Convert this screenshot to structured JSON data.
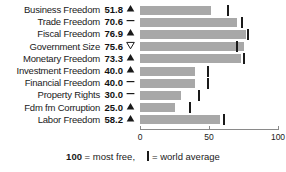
{
  "chart_data": {
    "type": "bar",
    "title": "",
    "xlabel": "",
    "ylabel": "",
    "xlim": [
      0,
      100
    ],
    "ticks": [
      0,
      50,
      100
    ],
    "tick_labels": [
      "0",
      "50",
      "100"
    ],
    "grid": false,
    "orientation": "horizontal",
    "legend": {
      "most_free_value": "100",
      "most_free_text": "= most free,",
      "world_average_text": "= world average"
    },
    "series_name": "Score",
    "world_average_series": "World average",
    "categories": [
      "Business Freedom",
      "Trade Freedom",
      "Fiscal Freedom",
      "Government Size",
      "Monetary Freedom",
      "Investment Freedom",
      "Financial Freedom",
      "Property Rights",
      "Fdm fm Corruption",
      "Labor Freedom"
    ],
    "values": [
      51.8,
      70.6,
      76.9,
      75.6,
      73.3,
      40.0,
      40.0,
      30.0,
      25.0,
      58.2
    ],
    "value_labels": [
      "51.8",
      "70.6",
      "76.9",
      "75.6",
      "73.3",
      "40.0",
      "40.0",
      "30.0",
      "25.0",
      "58.2"
    ],
    "world_average": [
      64.0,
      74.0,
      78.0,
      70.0,
      75.0,
      49.0,
      49.0,
      43.0,
      36.0,
      61.0
    ],
    "trends": [
      "up",
      "flat",
      "up",
      "down",
      "up",
      "up",
      "flat",
      "flat",
      "up",
      "up"
    ],
    "colors": {
      "bar": "#a8a8a8",
      "world_average_marker": "#1a1a1a",
      "text": "#1a1a1a",
      "axis": "#8a8a8a",
      "background": "#ffffff"
    },
    "rows": [
      {
        "label": "Business Freedom",
        "value": "51.8",
        "v": 51.8,
        "avg": 64.0,
        "trend": "up"
      },
      {
        "label": "Trade Freedom",
        "value": "70.6",
        "v": 70.6,
        "avg": 74.0,
        "trend": "flat"
      },
      {
        "label": "Fiscal Freedom",
        "value": "76.9",
        "v": 76.9,
        "avg": 78.0,
        "trend": "up"
      },
      {
        "label": "Government Size",
        "value": "75.6",
        "v": 75.6,
        "avg": 70.0,
        "trend": "down"
      },
      {
        "label": "Monetary Freedom",
        "value": "73.3",
        "v": 73.3,
        "avg": 75.0,
        "trend": "up"
      },
      {
        "label": "Investment Freedom",
        "value": "40.0",
        "v": 40.0,
        "avg": 49.0,
        "trend": "up"
      },
      {
        "label": "Financial Freedom",
        "value": "40.0",
        "v": 40.0,
        "avg": 49.0,
        "trend": "flat"
      },
      {
        "label": "Property Rights",
        "value": "30.0",
        "v": 30.0,
        "avg": 43.0,
        "trend": "flat"
      },
      {
        "label": "Fdm fm Corruption",
        "value": "25.0",
        "v": 25.0,
        "avg": 36.0,
        "trend": "up"
      },
      {
        "label": "Labor Freedom",
        "value": "58.2",
        "v": 58.2,
        "avg": 61.0,
        "trend": "up"
      }
    ]
  }
}
